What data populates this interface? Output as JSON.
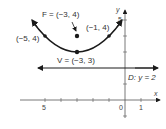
{
  "diagram": {
    "focus": {
      "label": "F = (−3, 4)",
      "x": -3,
      "y": 4
    },
    "vertex": {
      "label": "V = (−3, 3)",
      "x": -3,
      "y": 3
    },
    "directrix": {
      "label": "D: y = 2",
      "y": 2
    },
    "points": [
      {
        "label": "(−5, 4)",
        "x": -5,
        "y": 4
      },
      {
        "label": "(−1, 4)",
        "x": -1,
        "y": 4
      }
    ],
    "axes": {
      "x_label": "x",
      "y_label": "y",
      "x_ticks": [
        {
          "value": -5,
          "label": "5"
        },
        {
          "value": 0,
          "label": "0"
        },
        {
          "value": 1,
          "label": "1"
        }
      ],
      "y_ticks": [
        {
          "value": 5,
          "label": "5"
        }
      ]
    },
    "colors": {
      "ink": "#1a1a1a",
      "text": "#333333"
    }
  }
}
